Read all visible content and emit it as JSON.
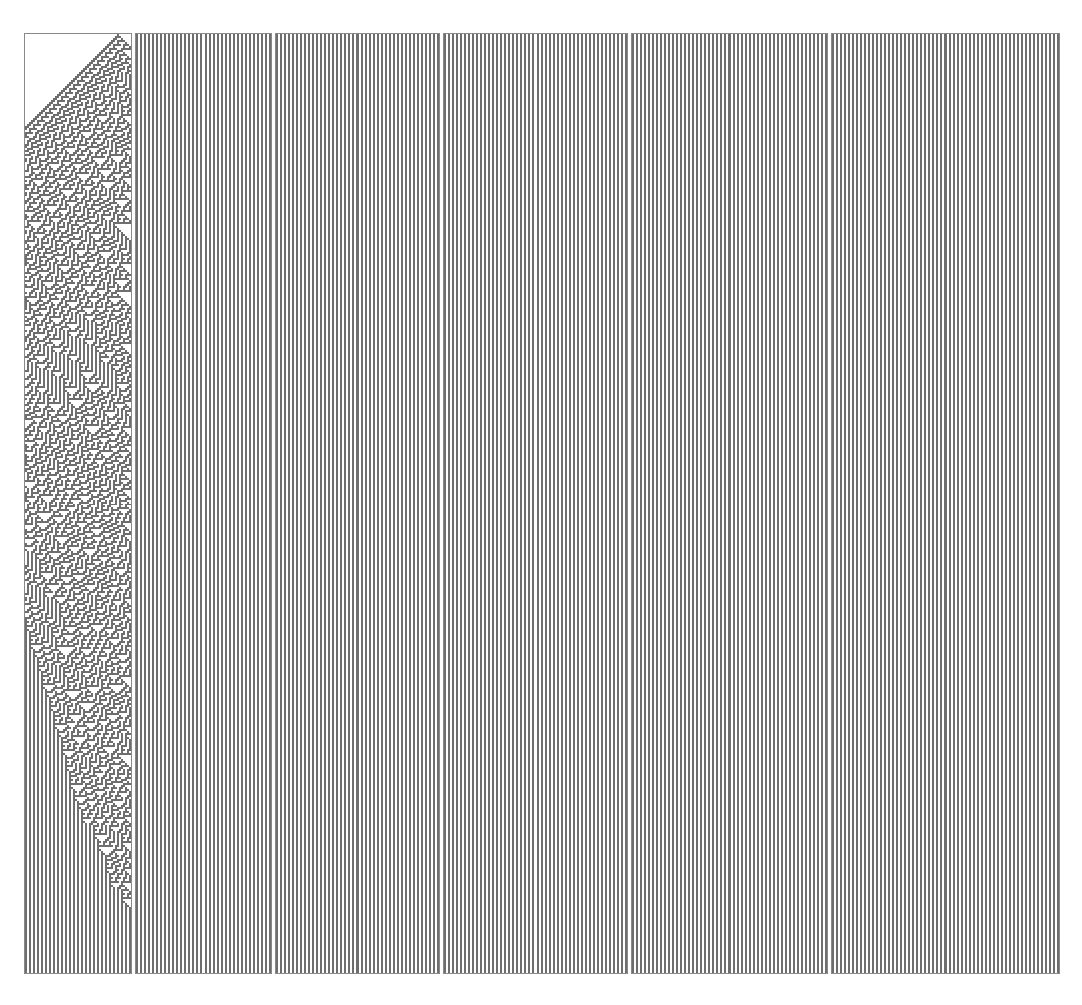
{
  "figure": {
    "background_color": "#ffffff",
    "cell_on_color": "#6e6e6e",
    "cell_off_color": "#ffffff",
    "panel_border_color": "#8a8a8a",
    "panel_count": 6,
    "width_px": 1082,
    "height_px": 1005
  },
  "chart_data": {
    "type": "heatmap",
    "xlabel": "",
    "ylabel": "",
    "rule_number": 30,
    "rule_table": {
      "111": 0,
      "110": 0,
      "101": 0,
      "100": 1,
      "011": 1,
      "010": 1,
      "001": 1,
      "000": 0
    },
    "neighborhood": 3,
    "states": 2,
    "initial_condition": "single black cell",
    "rows_per_panel": 470,
    "row_height_px": 2,
    "cell_width_px": 2,
    "grid": false,
    "legend": "none",
    "panels": [
      {
        "index": 1,
        "label": "panel-1",
        "x_px": 24,
        "y_px": 33,
        "width_px": 108,
        "height_px": 941,
        "columns": 53,
        "start_step": 0,
        "end_step": 470,
        "seed_column": 47,
        "fill_fraction": 0.18
      },
      {
        "index": 2,
        "label": "panel-2",
        "x_px": 135,
        "y_px": 33,
        "width_px": 137,
        "height_px": 941,
        "columns": 67,
        "start_step": 470,
        "end_step": 940,
        "seed_column": 60,
        "fill_fraction": 0.42
      },
      {
        "index": 3,
        "label": "panel-3",
        "x_px": 275,
        "y_px": 33,
        "width_px": 165,
        "height_px": 941,
        "columns": 81,
        "start_step": 940,
        "end_step": 1410,
        "seed_column": 74,
        "fill_fraction": 0.5
      },
      {
        "index": 4,
        "label": "panel-4",
        "x_px": 443,
        "y_px": 33,
        "width_px": 185,
        "height_px": 941,
        "columns": 91,
        "start_step": 1410,
        "end_step": 1880,
        "seed_column": 84,
        "fill_fraction": 0.55
      },
      {
        "index": 5,
        "label": "panel-5",
        "x_px": 631,
        "y_px": 33,
        "width_px": 197,
        "height_px": 941,
        "columns": 97,
        "start_step": 1880,
        "end_step": 2350,
        "seed_column": 90,
        "fill_fraction": 0.48
      },
      {
        "index": 6,
        "label": "panel-6",
        "x_px": 831,
        "y_px": 33,
        "width_px": 229,
        "height_px": 941,
        "columns": 113,
        "start_step": 2350,
        "end_step": 2820,
        "seed_column": 106,
        "fill_fraction": 0.6
      }
    ]
  }
}
